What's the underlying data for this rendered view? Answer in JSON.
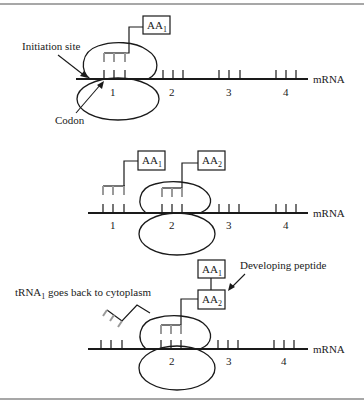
{
  "frame": {
    "border_color": "#8a8a8a"
  },
  "colors": {
    "ink": "#1a1a1a",
    "trna_gray": "#9a9a9a"
  },
  "panel1": {
    "initiation_label": "Initiation site",
    "codon_label": "Codon",
    "mrna_label": "mRNA",
    "aa_box": {
      "base": "AA",
      "sub": "1"
    },
    "codon_numbers": [
      "1",
      "2",
      "3",
      "4"
    ]
  },
  "panel2": {
    "mrna_label": "mRNA",
    "aa_boxes": [
      {
        "base": "AA",
        "sub": "1"
      },
      {
        "base": "AA",
        "sub": "2"
      }
    ],
    "codon_numbers": [
      "1",
      "2",
      "3",
      "4"
    ]
  },
  "panel3": {
    "trna_label_base": "tRNA",
    "trna_label_sub": "1",
    "trna_label_rest": " goes back to cytoplasm",
    "peptide_label": "Developing peptide",
    "mrna_label": "mRNA",
    "aa_boxes": [
      {
        "base": "AA",
        "sub": "1"
      },
      {
        "base": "AA",
        "sub": "2"
      }
    ],
    "codon_numbers": [
      "2",
      "3",
      "4"
    ]
  }
}
